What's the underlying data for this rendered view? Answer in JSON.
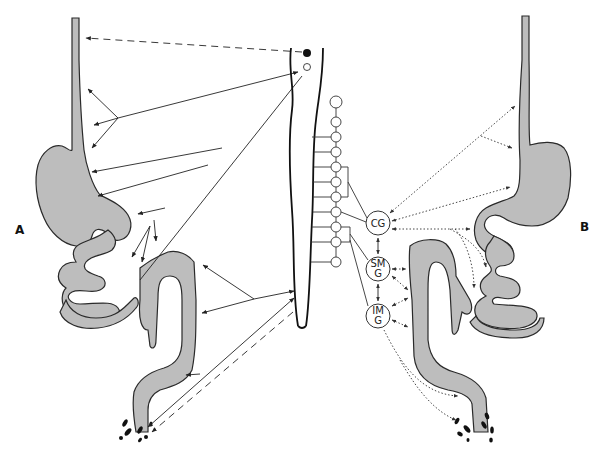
{
  "figure": {
    "panels": [
      {
        "id": "A",
        "label": "A",
        "pathway_style": "solid and dashed arrows"
      },
      {
        "id": "B",
        "label": "B",
        "pathway_style": "dotted arrows"
      }
    ],
    "ganglia": [
      {
        "id": "cg",
        "label": "CG"
      },
      {
        "id": "smg",
        "label_line1": "SM",
        "label_line2": "G"
      },
      {
        "id": "img",
        "label_line1": "IM",
        "label_line2": "G"
      }
    ],
    "sympathetic_chain_count": 11,
    "spinal_nuclei": [
      {
        "type": "filled"
      },
      {
        "type": "open"
      }
    ],
    "colors": {
      "gut_fill": "#bdbdbd",
      "outline": "#2a2a2a",
      "background": "#ffffff"
    }
  }
}
